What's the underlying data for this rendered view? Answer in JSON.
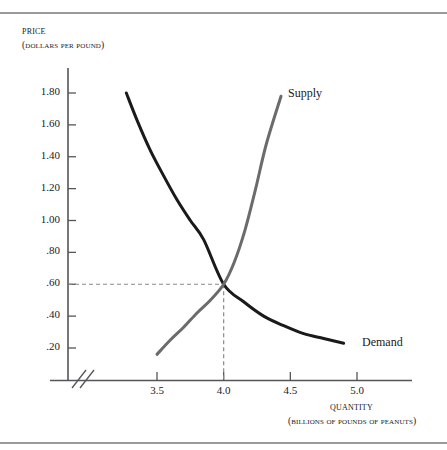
{
  "figure": {
    "background": "#ffffff",
    "rule_color": "#9a9a9e"
  },
  "axes": {
    "price_title": "Price",
    "price_subtitle": "(Dollars per pound)",
    "quantity_title": "Quantity",
    "quantity_subtitle": "(Billions of pounds of peanuts)"
  },
  "labels": {
    "supply": "Supply",
    "demand": "Demand"
  },
  "chart_data": {
    "type": "line",
    "title": "",
    "xlabel": "Quantity (Billions of pounds of peanuts)",
    "ylabel": "Price (Dollars per pound)",
    "xlim": [
      3.2,
      5.15
    ],
    "ylim": [
      0.0,
      1.95
    ],
    "grid": false,
    "legend_position": "inline-curve-end",
    "axis_break": {
      "axis": "x",
      "style": "double-slash",
      "position": 3.32
    },
    "xticks": [
      3.5,
      4.0,
      4.5,
      5.0
    ],
    "xtick_labels": [
      "3.5",
      "4.0",
      "4.5",
      "5.0"
    ],
    "yticks": [
      0.2,
      0.4,
      0.6,
      0.8,
      1.0,
      1.2,
      1.4,
      1.6,
      1.8
    ],
    "ytick_labels": [
      ".20",
      ".40",
      ".60",
      ".80",
      "1.00",
      "1.20",
      "1.40",
      "1.60",
      "1.80"
    ],
    "series": [
      {
        "name": "Demand",
        "color": "#1a1a1a",
        "linewidth": 3,
        "x": [
          3.27,
          3.35,
          3.45,
          3.55,
          3.65,
          3.75,
          3.85,
          4.0,
          4.15,
          4.3,
          4.45,
          4.6,
          4.75,
          4.9
        ],
        "values": [
          1.8,
          1.63,
          1.44,
          1.28,
          1.13,
          1.0,
          0.88,
          0.6,
          0.49,
          0.4,
          0.34,
          0.29,
          0.26,
          0.23
        ]
      },
      {
        "name": "Supply",
        "color": "#6b6b6b",
        "linewidth": 3,
        "x": [
          3.5,
          3.6,
          3.7,
          3.8,
          3.9,
          4.0,
          4.08,
          4.16,
          4.24,
          4.32,
          4.43
        ],
        "values": [
          0.16,
          0.25,
          0.33,
          0.42,
          0.5,
          0.6,
          0.74,
          0.94,
          1.2,
          1.48,
          1.78
        ]
      }
    ],
    "equilibrium": {
      "label": "",
      "quantity": 4.0,
      "price": 0.6,
      "guide_style": "dashed",
      "guide_color": "#8a8a8a"
    }
  }
}
